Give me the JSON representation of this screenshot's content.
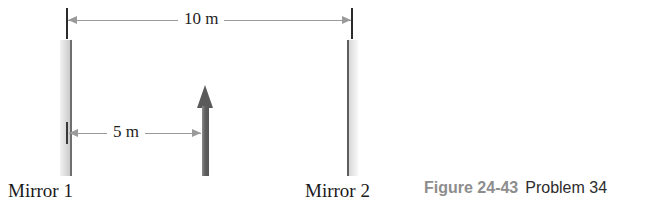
{
  "figure": {
    "caption_number": "Figure 24-43",
    "caption_problem": "Problem 34",
    "background_color": "#ffffff"
  },
  "diagram": {
    "mirrors": [
      {
        "label": "Mirror 1",
        "side": "left",
        "face_color": "#6f6f6f",
        "body_color": "#e3e3e3"
      },
      {
        "label": "Mirror 2",
        "side": "right",
        "face_color": "#5d5d5d",
        "body_color": "#e3e3e3"
      }
    ],
    "object": {
      "name": "object-arrow",
      "direction": "up",
      "color": "#5a5a5a"
    },
    "dimensions": [
      {
        "label": "10 m",
        "value": 10,
        "unit": "m",
        "from": "Mirror 1",
        "to": "Mirror 2",
        "line_color": "#9a9a9a"
      },
      {
        "label": "5 m",
        "value": 5,
        "unit": "m",
        "from": "Mirror 1",
        "to": "object-arrow",
        "line_color": "#9a9a9a"
      }
    ]
  }
}
